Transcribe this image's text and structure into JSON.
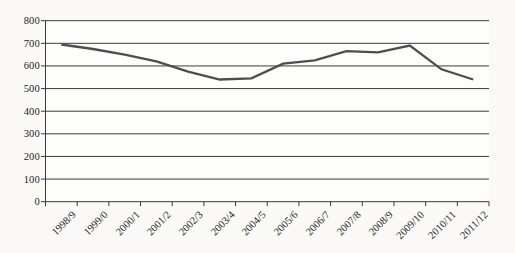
{
  "page": {
    "background": "#faf9f6",
    "plot_background": "#fdfdfc"
  },
  "chart_data": {
    "type": "line",
    "title": "",
    "xlabel": "",
    "ylabel": "",
    "categories": [
      "1998/9",
      "1999/0",
      "2000/1",
      "2001/2",
      "2002/3",
      "2003/4",
      "2004/5",
      "2005/6",
      "2006/7",
      "2007/8",
      "2008/9",
      "2009/10",
      "2010/11",
      "2011/12"
    ],
    "values": [
      695,
      675,
      650,
      620,
      575,
      540,
      545,
      610,
      625,
      665,
      660,
      690,
      585,
      540
    ],
    "ylim": [
      0,
      800
    ],
    "yticks": [
      0,
      100,
      200,
      300,
      400,
      500,
      600,
      700,
      800
    ],
    "grid": "horizontal",
    "legend": "none",
    "line_color": "#4e4e51",
    "grid_color": "#3b3b3b",
    "axis_color": "#3b3b3b",
    "text_color": "#1c1c1c"
  }
}
